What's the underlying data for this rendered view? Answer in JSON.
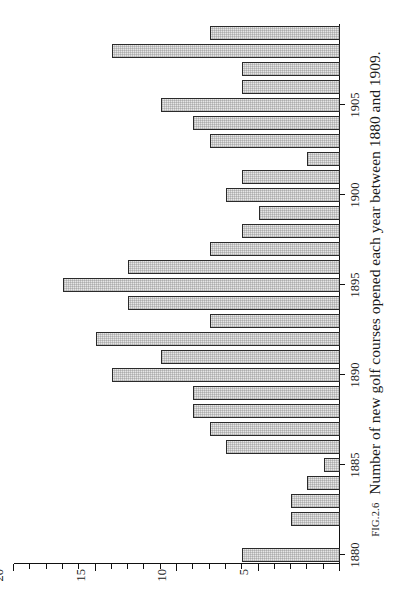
{
  "figure": {
    "number_label": "FIG.2.6",
    "caption": "Number of new golf courses opened each year between 1880 and 1909."
  },
  "chart_data": {
    "type": "bar",
    "title": "",
    "xlabel": "",
    "ylabel": "",
    "orientation": "vertical",
    "rotation_degrees": 90,
    "grid": false,
    "legend": null,
    "ylim": [
      0,
      20
    ],
    "ytick_major": [
      0,
      5,
      10,
      15,
      20
    ],
    "ytick_labels": [
      "",
      "5",
      "10",
      "15",
      "20"
    ],
    "ytick_minor_step": 1,
    "xtick_labelled": [
      "1880",
      "1885",
      "1890",
      "1895",
      "1900",
      "1905"
    ],
    "bar_fill": "#e6e6e6",
    "bar_edge": "#2a2a2a",
    "categories": [
      "1880",
      "1881",
      "1882",
      "1883",
      "1884",
      "1885",
      "1886",
      "1887",
      "1888",
      "1889",
      "1890",
      "1891",
      "1892",
      "1893",
      "1894",
      "1895",
      "1896",
      "1897",
      "1898",
      "1899",
      "1900",
      "1901",
      "1902",
      "1903",
      "1904",
      "1905",
      "1906",
      "1907",
      "1908",
      "1909"
    ],
    "values": [
      6,
      0,
      3,
      3,
      2,
      1,
      7,
      8,
      9,
      9,
      14,
      11,
      15,
      8,
      13,
      17,
      13,
      8,
      6,
      5,
      7,
      6,
      2,
      8,
      9,
      11,
      6,
      6,
      14,
      8
    ]
  }
}
